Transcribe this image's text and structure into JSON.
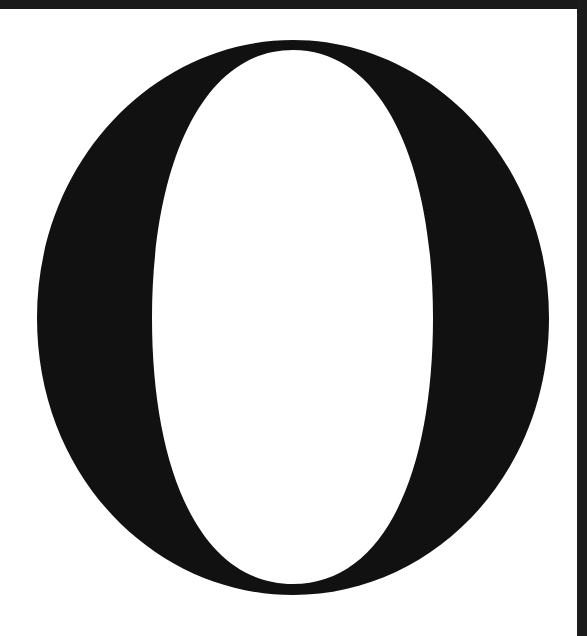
{
  "glyph": {
    "character": "O",
    "style": "serif capital letter",
    "fill_color": "#111111",
    "background_color": "#ffffff"
  },
  "frame": {
    "color": "#1a1a1a"
  }
}
